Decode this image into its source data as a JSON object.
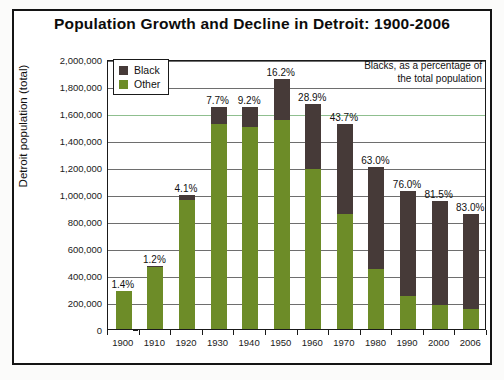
{
  "chart_data": {
    "type": "bar",
    "subtype": "stacked",
    "title": "Population Growth and Decline in Detroit: 1900-2006",
    "xlabel": "",
    "ylabel": "Detroit population (total)",
    "ylim": [
      0,
      2000000
    ],
    "ytick_labels": [
      "2,000,000",
      "1,800,000",
      "1,600,000",
      "1,400,000",
      "1,200,000",
      "1,000,000",
      "800,000",
      "600,000",
      "400,000",
      "200,000",
      "0"
    ],
    "ytick_values": [
      2000000,
      1800000,
      1600000,
      1400000,
      1200000,
      1000000,
      800000,
      600000,
      400000,
      200000,
      0
    ],
    "grid": true,
    "legend_position": "upper-left-inside",
    "annotation": [
      "Blacks, as a percentage of",
      "the total population"
    ],
    "categories": [
      "1900",
      "1910",
      "1920",
      "1930",
      "1940",
      "1950",
      "1960",
      "1970",
      "1980",
      "1990",
      "2000",
      "2006"
    ],
    "series": [
      {
        "name": "Other",
        "color": "#6d8c28",
        "values": [
          281000,
          460000,
          952000,
          1515000,
          1494000,
          1550000,
          1186000,
          855000,
          444000,
          244000,
          176000,
          145000
        ]
      },
      {
        "name": "Black",
        "color": "#463a38",
        "values": [
          4000,
          6000,
          41000,
          126000,
          151000,
          300000,
          482000,
          664000,
          758000,
          778000,
          775000,
          708000
        ]
      }
    ],
    "totals": [
      285000,
      466000,
      993000,
      1641000,
      1645000,
      1850000,
      1668000,
      1519000,
      1202000,
      1022000,
      951000,
      853000
    ],
    "data_labels": [
      "1.4%",
      "1.2%",
      "4.1%",
      "7.7%",
      "9.2%",
      "16.2%",
      "28.9%",
      "43.7%",
      "63.0%",
      "76.0%",
      "81.5%",
      "83.0%"
    ],
    "label_note": "percentage of total population that is Black"
  },
  "legend": {
    "items": [
      {
        "label": "Black",
        "color": "#463a38"
      },
      {
        "label": "Other",
        "color": "#6d8c28"
      }
    ]
  }
}
